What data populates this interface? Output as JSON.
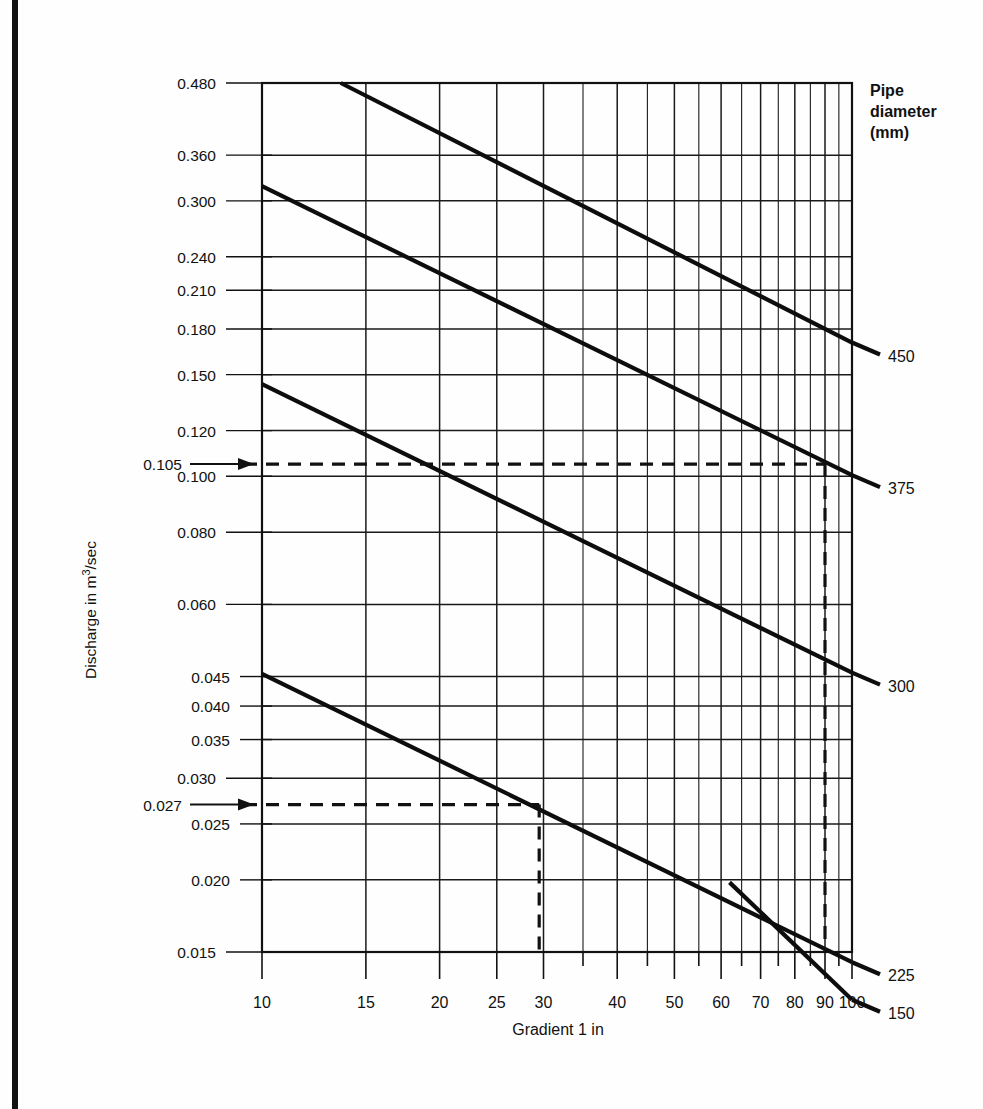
{
  "figure": {
    "kind": "nomogram",
    "background": "#ffffff",
    "ink": "#111111"
  },
  "chart_data": {
    "type": "line",
    "title": "",
    "subtitle": "",
    "xlabel": "Gradient 1 in",
    "ylabel": "Discharge in m3/sec",
    "ylabel_display": "Discharge in m",
    "ylabel_exponent": "3",
    "ylabel_tail": "/sec",
    "xscale": "log",
    "yscale": "log",
    "xlim": [
      10,
      100
    ],
    "ylim": [
      0.015,
      0.48
    ],
    "grid": true,
    "legend_position": "right",
    "legend_title_lines": [
      "Pipe",
      "diameter",
      "(mm)"
    ],
    "xticks": [
      10,
      15,
      20,
      25,
      30,
      40,
      50,
      60,
      70,
      80,
      90,
      100
    ],
    "xtick_labels": [
      "10",
      "15",
      "20",
      "25",
      "30",
      "40",
      "50",
      "60",
      "70",
      "80",
      "90",
      "100"
    ],
    "x_minor_ticks": [
      35,
      45,
      55,
      65,
      75,
      85,
      95
    ],
    "yticks": [
      0.015,
      0.02,
      0.025,
      0.03,
      0.035,
      0.04,
      0.045,
      0.06,
      0.08,
      0.1,
      0.12,
      0.15,
      0.18,
      0.21,
      0.24,
      0.3,
      0.36,
      0.48
    ],
    "ytick_labels": [
      "0.015",
      "0.020",
      "0.025",
      "0.030",
      "0.035",
      "0.040",
      "0.045",
      "0.060",
      "0.080",
      "0.100",
      "0.120",
      "0.150",
      "0.180",
      "0.210",
      "0.240",
      "0.300",
      "0.360",
      "0.480"
    ],
    "series": [
      {
        "name": "450",
        "label": "450",
        "x": [
          13.6,
          100
        ],
        "y": [
          0.48,
          0.1705
        ]
      },
      {
        "name": "375",
        "label": "375",
        "x": [
          10,
          100
        ],
        "y": [
          0.318,
          0.1005
        ]
      },
      {
        "name": "300",
        "label": "300",
        "x": [
          10,
          100
        ],
        "y": [
          0.1445,
          0.0457
        ]
      },
      {
        "name": "225",
        "label": "225",
        "x": [
          10,
          100
        ],
        "y": [
          0.0455,
          0.0144
        ]
      },
      {
        "name": "150",
        "label": "150",
        "x": [
          62,
          100
        ],
        "y": [
          0.0198,
          0.0124
        ]
      }
    ],
    "annotations": [
      {
        "id": "annot-0105",
        "label": "0.105",
        "y_value": 0.105,
        "x_value": 90,
        "series": "300",
        "horizontal_dash": true,
        "vertical_dash": true,
        "arrow": "right"
      },
      {
        "id": "annot-0027",
        "label": "0.027",
        "y_value": 0.027,
        "x_value": 29.5,
        "series": "225",
        "horizontal_dash": true,
        "vertical_dash": true,
        "arrow": "right"
      }
    ]
  }
}
